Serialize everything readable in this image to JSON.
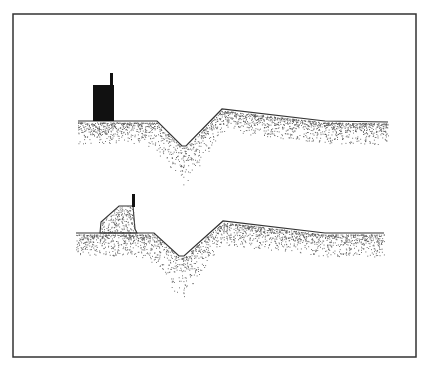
{
  "figure": {
    "frame": {
      "x": 13,
      "y": 14,
      "width": 403,
      "height": 343,
      "stroke": "#333333"
    },
    "colors": {
      "line": "#333333",
      "stipple": "#555555",
      "building": "#111111",
      "background": "#ffffff"
    },
    "panels": [
      {
        "id": "upper",
        "label": "intact-building-section",
        "ground_line": [
          [
            78,
            121
          ],
          [
            157,
            121
          ],
          [
            182,
            146
          ],
          [
            186,
            146
          ],
          [
            222,
            109
          ],
          [
            325,
            121
          ],
          [
            388,
            122
          ]
        ],
        "building": {
          "x": 93,
          "y": 85,
          "width": 21,
          "height": 36
        },
        "chimney": {
          "x": 110,
          "y": 73,
          "width": 3,
          "height": 13
        },
        "stipple_depth": 38
      },
      {
        "id": "lower",
        "label": "collapsed-building-section",
        "ground_line": [
          [
            76,
            233
          ],
          [
            154,
            233
          ],
          [
            179,
            256
          ],
          [
            184,
            256
          ],
          [
            223,
            221
          ],
          [
            325,
            233
          ],
          [
            384,
            233
          ]
        ],
        "mound": [
          [
            100,
            233
          ],
          [
            101,
            222
          ],
          [
            119,
            206
          ],
          [
            133,
            206
          ],
          [
            135,
            229
          ],
          [
            137,
            233
          ]
        ],
        "chimney": {
          "x": 132,
          "y": 194,
          "width": 3,
          "height": 13
        },
        "stipple_depth": 40
      }
    ]
  }
}
